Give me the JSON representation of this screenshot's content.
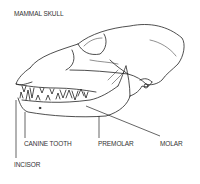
{
  "diagram": {
    "title": "MAMMAL SKULL",
    "labels": {
      "canine": "CANINE TOOTH",
      "premolar": "PREMOLAR",
      "molar": "MOLAR",
      "incisor": "INCISOR"
    }
  }
}
